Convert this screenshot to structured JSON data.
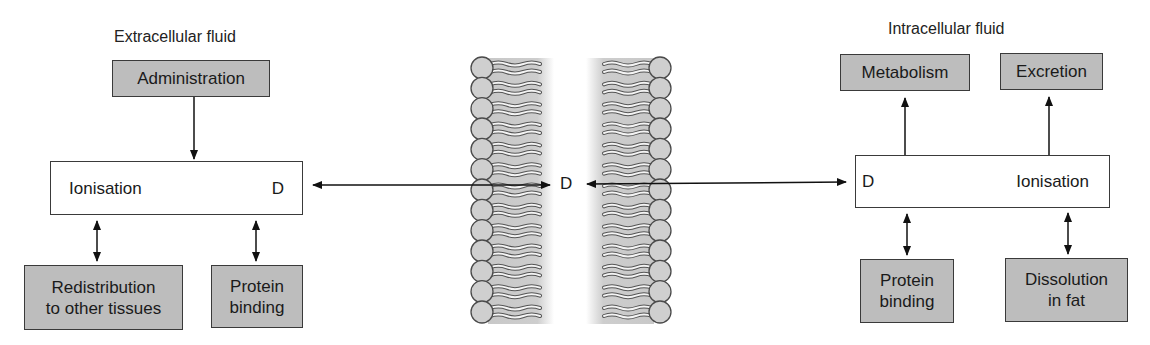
{
  "diagram": {
    "extracellular": {
      "title": "Extracellular fluid",
      "administration": "Administration",
      "equilibrium": {
        "left": "Ionisation",
        "right": "D"
      },
      "redistribution": "Redistribution\nto other tissues",
      "protein_binding": "Protein\nbinding"
    },
    "membrane": {
      "center_label": "D",
      "heads_per_leaflet": 13
    },
    "intracellular": {
      "title": "Intracellular fluid",
      "metabolism": "Metabolism",
      "excretion": "Excretion",
      "equilibrium": {
        "left": "D",
        "right": "Ionisation"
      },
      "protein_binding": "Protein\nbinding",
      "dissolution": "Dissolution\nin fat"
    },
    "colors": {
      "grey_box": "#bdbdbd",
      "membrane_head": "#cfcfcf",
      "membrane_shade": "#c8c8c8",
      "line": "#111111"
    }
  }
}
